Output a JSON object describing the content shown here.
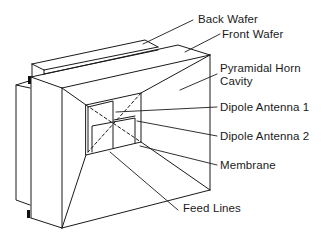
{
  "figure": {
    "type": "labeled technical illustration",
    "labels": [
      {
        "id": "back-wafer",
        "text": "Back Wafer"
      },
      {
        "id": "front-wafer",
        "text": "Front Wafer"
      },
      {
        "id": "pyramidal-horn-cavity",
        "text": "Pyramidal Horn\nCavity"
      },
      {
        "id": "dipole-antenna-1",
        "text": "Dipole Antenna 1"
      },
      {
        "id": "dipole-antenna-2",
        "text": "Dipole Antenna 2"
      },
      {
        "id": "membrane",
        "text": "Membrane"
      },
      {
        "id": "feed-lines",
        "text": "Feed Lines"
      }
    ],
    "colors": {
      "line": "#1a1a1a",
      "background": "#ffffff"
    }
  }
}
